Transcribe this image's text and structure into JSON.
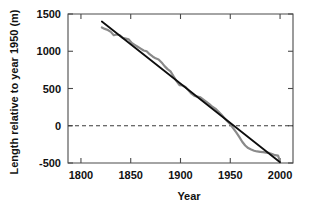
{
  "chart_data": {
    "type": "line",
    "title": "",
    "xlabel": "Year",
    "ylabel": "Length relative to year 1950 (m)",
    "xlim": [
      1787,
      2013
    ],
    "ylim": [
      -500,
      1500
    ],
    "xticks": [
      1800,
      1850,
      1900,
      1950,
      2000
    ],
    "xtick_labels": [
      "1800",
      "1850",
      "1900",
      "1950",
      "2000"
    ],
    "yticks": [
      -500,
      0,
      500,
      1000,
      1500
    ],
    "ytick_labels": [
      "-500",
      "0",
      "500",
      "1000",
      "1500"
    ],
    "grid": false,
    "legend": "none",
    "annotations": [
      {
        "type": "reference-line",
        "orientation": "horizontal",
        "value": 0,
        "style": "dashed",
        "color": "#3a3a3a"
      }
    ],
    "series": [
      {
        "name": "Observed glacier length",
        "color": "#8a8a8a",
        "style": "solid",
        "x": [
          1821,
          1824,
          1827,
          1830,
          1833,
          1836,
          1839,
          1842,
          1845,
          1848,
          1851,
          1854,
          1857,
          1860,
          1863,
          1866,
          1869,
          1872,
          1875,
          1878,
          1881,
          1884,
          1887,
          1890,
          1893,
          1896,
          1899,
          1902,
          1905,
          1908,
          1911,
          1914,
          1917,
          1920,
          1923,
          1926,
          1929,
          1932,
          1935,
          1938,
          1941,
          1944,
          1947,
          1950,
          1953,
          1956,
          1959,
          1962,
          1965,
          1968,
          1971,
          1974,
          1977,
          1980,
          1983,
          1986,
          1989,
          1992,
          1995,
          1998,
          1999,
          2000
        ],
        "y": [
          1320,
          1300,
          1285,
          1260,
          1215,
          1225,
          1215,
          1180,
          1170,
          1160,
          1110,
          1085,
          1060,
          1035,
          1010,
          1000,
          960,
          930,
          905,
          890,
          850,
          800,
          760,
          730,
          665,
          600,
          545,
          540,
          520,
          475,
          430,
          400,
          390,
          380,
          350,
          320,
          290,
          255,
          230,
          190,
          150,
          105,
          60,
          20,
          -35,
          -90,
          -150,
          -215,
          -265,
          -300,
          -320,
          -335,
          -345,
          -350,
          -355,
          -360,
          -365,
          -380,
          -395,
          -400,
          -440,
          -490
        ]
      },
      {
        "name": "Linear trend",
        "color": "#0d0d0d",
        "style": "solid",
        "x": [
          1821,
          2000
        ],
        "y": [
          1400,
          -490
        ]
      }
    ]
  }
}
